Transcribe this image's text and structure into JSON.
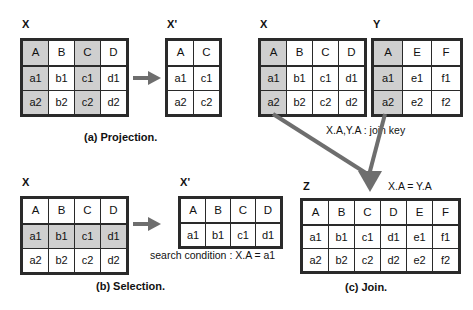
{
  "figure": {
    "accent_shade": "#cfcfcf",
    "arrow_color": "#6e6e6e",
    "border_color": "#2a2a2a"
  },
  "panels": [
    {
      "id": "projection",
      "caption": "(a)  Projection.",
      "tables": [
        {
          "id": "proj-x",
          "name": "X",
          "columns": [
            "A",
            "B",
            "C",
            "D"
          ],
          "rows": [
            [
              "a1",
              "b1",
              "c1",
              "d1"
            ],
            [
              "a2",
              "b2",
              "c2",
              "d2"
            ]
          ],
          "shaded_columns": [
            0,
            2
          ]
        },
        {
          "id": "proj-xprime",
          "name": "X'",
          "columns": [
            "A",
            "C"
          ],
          "rows": [
            [
              "a1",
              "c1"
            ],
            [
              "a2",
              "c2"
            ]
          ],
          "shaded_columns": []
        }
      ]
    },
    {
      "id": "selection",
      "caption": "(b)  Selection.",
      "condition": "search condition : X.A = a1",
      "tables": [
        {
          "id": "sel-x",
          "name": "X",
          "columns": [
            "A",
            "B",
            "C",
            "D"
          ],
          "rows": [
            [
              "a1",
              "b1",
              "c1",
              "d1"
            ],
            [
              "a2",
              "b2",
              "c2",
              "d2"
            ]
          ],
          "shaded_rows": [
            0
          ]
        },
        {
          "id": "sel-xprime",
          "name": "X'",
          "columns": [
            "A",
            "B",
            "C",
            "D"
          ],
          "rows": [
            [
              "a1",
              "b1",
              "c1",
              "d1"
            ]
          ],
          "shaded_rows": []
        }
      ]
    },
    {
      "id": "join",
      "caption": "(c)  Join.",
      "join_key_note": "X.A,Y.A : join key",
      "join_condition": "X.A = Y.A",
      "tables": [
        {
          "id": "join-x",
          "name": "X",
          "columns": [
            "A",
            "B",
            "C",
            "D"
          ],
          "rows": [
            [
              "a1",
              "b1",
              "c1",
              "d1"
            ],
            [
              "a2",
              "b2",
              "c2",
              "d2"
            ]
          ],
          "shaded_columns": [
            0
          ]
        },
        {
          "id": "join-y",
          "name": "Y",
          "columns": [
            "A",
            "E",
            "F"
          ],
          "rows": [
            [
              "a1",
              "e1",
              "f1"
            ],
            [
              "a2",
              "e2",
              "f2"
            ]
          ],
          "shaded_columns": [
            0
          ]
        },
        {
          "id": "join-z",
          "name": "Z",
          "columns": [
            "A",
            "B",
            "C",
            "D",
            "E",
            "F"
          ],
          "rows": [
            [
              "a1",
              "b1",
              "c1",
              "d1",
              "e1",
              "f1"
            ],
            [
              "a2",
              "b2",
              "c2",
              "d2",
              "e2",
              "f2"
            ]
          ],
          "shaded_columns": []
        }
      ]
    }
  ]
}
